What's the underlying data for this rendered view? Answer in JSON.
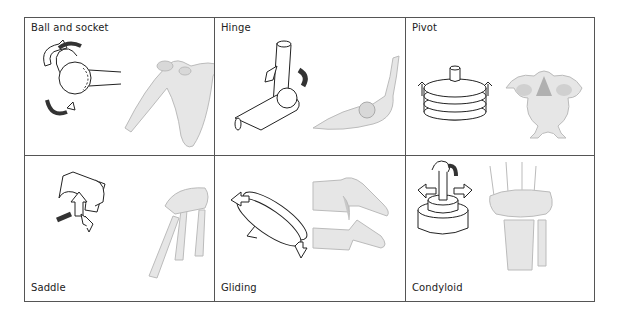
{
  "figure": {
    "panels": [
      {
        "label": "Ball and socket",
        "example": "shoulder"
      },
      {
        "label": "Hinge",
        "example": "elbow"
      },
      {
        "label": "Pivot",
        "example": "atlas vertebra"
      },
      {
        "label": "Saddle",
        "example": "thumb"
      },
      {
        "label": "Gliding",
        "example": "vertebrae"
      },
      {
        "label": "Condyloid",
        "example": "wrist"
      }
    ]
  },
  "colors": {
    "border": "#555555",
    "bone_fill": "#e6e6e6",
    "bone_shade": "#b8b8b8",
    "line": "#222222",
    "arrow_dark": "#333333"
  }
}
